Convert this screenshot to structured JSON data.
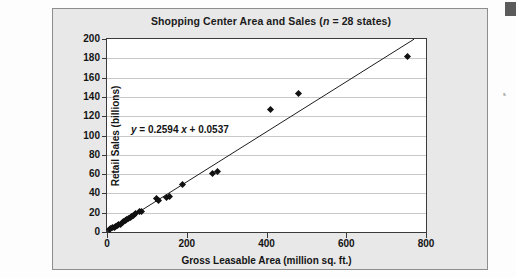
{
  "figure": {
    "title_prefix": "Shopping Center Area and Sales (",
    "title_italic": "n",
    "title_suffix": " = 28 states)",
    "background_color": "#e8e8e8",
    "border_color": "#8d8d8d",
    "plot_background": "#ffffff"
  },
  "margin": {
    "glyph": "s"
  },
  "chart_data": {
    "type": "scatter",
    "title": "Shopping Center Area and Sales (n = 28 states)",
    "xlabel": "Gross Leasable Area (million sq. ft.)",
    "ylabel": "Retail Sales (billions)",
    "xlim": [
      0,
      800
    ],
    "ylim": [
      0,
      200
    ],
    "xticks": [
      0,
      200,
      400,
      600,
      800
    ],
    "yticks": [
      0,
      20,
      40,
      60,
      80,
      100,
      120,
      140,
      160,
      180,
      200
    ],
    "grid": "horizontal",
    "legend": "none",
    "n": 28,
    "annotation": {
      "text": "y = 0.2594 x + 0.0537",
      "y_var": "y",
      "slope": 0.2594,
      "intercept": 0.0537,
      "x_var": "x"
    },
    "trendline": {
      "type": "linear",
      "slope": 0.2594,
      "intercept": 0.0537,
      "x_start": 0,
      "x_end": 770
    },
    "marker_color": "#111111",
    "marker_shape": "diamond",
    "points": [
      {
        "x": 6,
        "y": 3
      },
      {
        "x": 10,
        "y": 4
      },
      {
        "x": 14,
        "y": 5
      },
      {
        "x": 18,
        "y": 5
      },
      {
        "x": 22,
        "y": 6
      },
      {
        "x": 26,
        "y": 7
      },
      {
        "x": 30,
        "y": 8
      },
      {
        "x": 34,
        "y": 8
      },
      {
        "x": 38,
        "y": 10
      },
      {
        "x": 42,
        "y": 11
      },
      {
        "x": 46,
        "y": 12
      },
      {
        "x": 50,
        "y": 13
      },
      {
        "x": 54,
        "y": 14
      },
      {
        "x": 58,
        "y": 15
      },
      {
        "x": 62,
        "y": 16
      },
      {
        "x": 66,
        "y": 17
      },
      {
        "x": 72,
        "y": 19
      },
      {
        "x": 82,
        "y": 21
      },
      {
        "x": 86,
        "y": 21
      },
      {
        "x": 124,
        "y": 35
      },
      {
        "x": 130,
        "y": 33
      },
      {
        "x": 150,
        "y": 36
      },
      {
        "x": 156,
        "y": 37
      },
      {
        "x": 190,
        "y": 49
      },
      {
        "x": 264,
        "y": 61
      },
      {
        "x": 278,
        "y": 63
      },
      {
        "x": 409,
        "y": 127
      },
      {
        "x": 480,
        "y": 144
      },
      {
        "x": 753,
        "y": 182
      }
    ]
  }
}
